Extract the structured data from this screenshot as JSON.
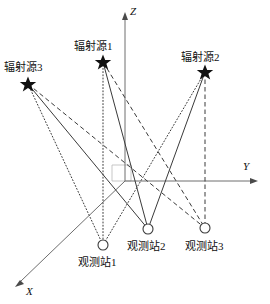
{
  "figure": {
    "type": "geometry-diagram",
    "width": 270,
    "height": 304,
    "background": "#ffffff",
    "line_color": "#3a3a3a",
    "axis_color": "#6e6e6e",
    "refbox_color": "#b9b9b9"
  },
  "axes": {
    "z": {
      "label": "Z",
      "label_x": 130,
      "label_y": 6,
      "from": [
        125,
        181
      ],
      "to": [
        125,
        15
      ]
    },
    "y": {
      "label": "Y",
      "label_x": 243,
      "label_y": 161,
      "from": [
        125,
        181
      ],
      "to": [
        256,
        181
      ]
    },
    "x": {
      "label": "X",
      "label_x": 26,
      "label_y": 286,
      "from": [
        125,
        181
      ],
      "to": [
        17,
        285
      ]
    },
    "origin": [
      125,
      181
    ]
  },
  "refbox": {
    "name": "origin-reference-box",
    "points": "112,165 131,165 131,181 112,181 112,165"
  },
  "sources": [
    {
      "id": "source1",
      "label": "辐射源1",
      "x": 103,
      "y": 62,
      "label_x": 74,
      "label_y": 40
    },
    {
      "id": "source2",
      "label": "辐射源2",
      "x": 205,
      "y": 72,
      "label_x": 181,
      "label_y": 51
    },
    {
      "id": "source3",
      "label": "辐射源3",
      "x": 28,
      "y": 84,
      "label_x": 4,
      "label_y": 61
    }
  ],
  "stations": [
    {
      "id": "station1",
      "label": "观测站1",
      "x": 103,
      "y": 245,
      "r": 5,
      "label_x": 78,
      "label_y": 256,
      "line_style": "dotted"
    },
    {
      "id": "station2",
      "label": "观测站2",
      "x": 148,
      "y": 229,
      "r": 5,
      "label_x": 127,
      "label_y": 240,
      "line_style": "solid"
    },
    {
      "id": "station3",
      "label": "观测站3",
      "x": 205,
      "y": 228,
      "r": 5,
      "label_x": 185,
      "label_y": 240,
      "line_style": "dashed"
    }
  ],
  "rays": [
    {
      "from": "source1",
      "to": "station1",
      "style": "dotted",
      "x1": 103,
      "y1": 62,
      "x2": 103,
      "y2": 245
    },
    {
      "from": "source1",
      "to": "station2",
      "style": "solid",
      "x1": 103,
      "y1": 62,
      "x2": 148,
      "y2": 229
    },
    {
      "from": "source1",
      "to": "station3",
      "style": "dashed",
      "x1": 103,
      "y1": 62,
      "x2": 205,
      "y2": 228
    },
    {
      "from": "source2",
      "to": "station1",
      "style": "dotted",
      "x1": 205,
      "y1": 72,
      "x2": 103,
      "y2": 245
    },
    {
      "from": "source2",
      "to": "station2",
      "style": "solid",
      "x1": 205,
      "y1": 72,
      "x2": 148,
      "y2": 229
    },
    {
      "from": "source2",
      "to": "station3",
      "style": "dashed",
      "x1": 205,
      "y1": 72,
      "x2": 205,
      "y2": 228
    },
    {
      "from": "source3",
      "to": "station1",
      "style": "dotted",
      "x1": 28,
      "y1": 84,
      "x2": 103,
      "y2": 245
    },
    {
      "from": "source3",
      "to": "station2",
      "style": "solid",
      "x1": 28,
      "y1": 84,
      "x2": 148,
      "y2": 229
    },
    {
      "from": "source3",
      "to": "station3",
      "style": "dashed",
      "x1": 28,
      "y1": 84,
      "x2": 205,
      "y2": 228
    }
  ]
}
